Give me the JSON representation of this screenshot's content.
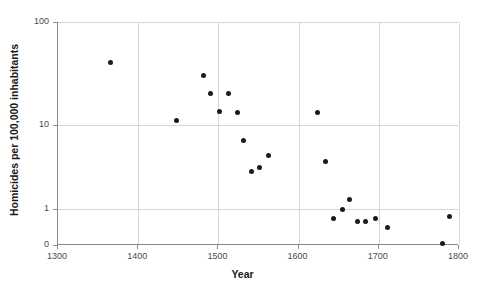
{
  "chart_data": {
    "type": "scatter",
    "title": "",
    "xlabel": "Year",
    "ylabel": "Homicides per 100,000 inhabitants",
    "xlim": [
      1300,
      1800
    ],
    "ylim": [
      0,
      100
    ],
    "yscale": "log",
    "grid": true,
    "legend": null,
    "xticks": [
      1300,
      1400,
      1500,
      1600,
      1700,
      1800
    ],
    "xticklabels": [
      "1300",
      "1400",
      "1500",
      "1600",
      "1700",
      "1800"
    ],
    "yticks": [
      0,
      1,
      10,
      100
    ],
    "yticklabels": [
      "0",
      "1",
      "10",
      "100"
    ],
    "marker": "circle",
    "marker_color": "#1a1a1a",
    "points": [
      {
        "x": 1365,
        "y": 40.0
      },
      {
        "x": 1448,
        "y": 11.0
      },
      {
        "x": 1481,
        "y": 30.0
      },
      {
        "x": 1490,
        "y": 20.0
      },
      {
        "x": 1501,
        "y": 13.5
      },
      {
        "x": 1513,
        "y": 20.0
      },
      {
        "x": 1524,
        "y": 13.0
      },
      {
        "x": 1531,
        "y": 6.5
      },
      {
        "x": 1541,
        "y": 2.8
      },
      {
        "x": 1551,
        "y": 3.1
      },
      {
        "x": 1563,
        "y": 4.3
      },
      {
        "x": 1624,
        "y": 13.0
      },
      {
        "x": 1634,
        "y": 3.6
      },
      {
        "x": 1644,
        "y": 0.75
      },
      {
        "x": 1655,
        "y": 1.0
      },
      {
        "x": 1664,
        "y": 1.3
      },
      {
        "x": 1674,
        "y": 0.65
      },
      {
        "x": 1684,
        "y": 0.65
      },
      {
        "x": 1696,
        "y": 0.75
      },
      {
        "x": 1711,
        "y": 0.5
      },
      {
        "x": 1779,
        "y": 0.05
      },
      {
        "x": 1788,
        "y": 0.78
      }
    ]
  },
  "axes": {
    "x_title": "Year",
    "y_title": "Homicides per 100,000 inhabitants"
  },
  "colors": {
    "marker": "#1a1a1a",
    "grid": "#d6d6d6",
    "axis": "#8a8a8a",
    "tick_text": "#4a4a4a",
    "title_text": "#1a1a1a",
    "background": "#ffffff"
  }
}
